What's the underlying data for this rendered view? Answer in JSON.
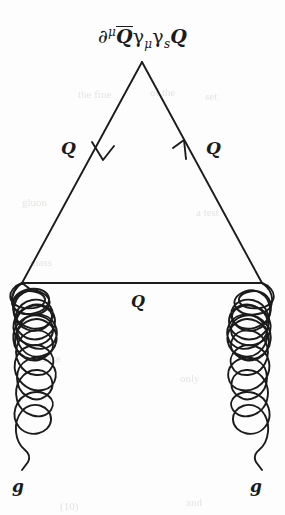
{
  "figure": {
    "kind": "feynman-diagram",
    "width": 285,
    "height": 515,
    "background_color": "#fdfdfd",
    "ink_color": "#1b1b1b"
  },
  "labels": {
    "operator": {
      "full_text": "∂ᵘ Q̄ γμ γs Q",
      "derivative": "∂",
      "derivative_superscript": "μ",
      "qbar": "Q",
      "gamma_one": "γ",
      "gamma_one_subscript": "μ",
      "gamma_two": "γ",
      "gamma_two_subscript": "s",
      "q_final": "Q"
    },
    "quark_left": "Q",
    "quark_right": "Q",
    "quark_middle": "Q",
    "gluon_left": "g",
    "gluon_right": "g"
  },
  "geometry": {
    "apex": {
      "x": 142,
      "y": 62
    },
    "bottom_left_vertex": {
      "x": 22,
      "y": 283
    },
    "bottom_right_vertex": {
      "x": 262,
      "y": 283
    },
    "gluon_left_x": 22,
    "gluon_right_x": 262,
    "gluon_top_y": 283,
    "gluon_bottom_y": 470,
    "gluon_loop_count": 6,
    "arrow_left": {
      "x": 101,
      "y": 154,
      "direction": "down-left"
    },
    "arrow_right": {
      "x": 184,
      "y": 154,
      "direction": "up-left"
    },
    "stroke_width": 1.9
  },
  "ghost_text": [
    {
      "text": "the fine",
      "x": 78,
      "y": 88
    },
    {
      "text": "of the",
      "x": 150,
      "y": 86
    },
    {
      "text": "set",
      "x": 205,
      "y": 90
    },
    {
      "text": "gluon",
      "x": 22,
      "y": 196
    },
    {
      "text": "a test",
      "x": 196,
      "y": 206
    },
    {
      "text": "mass",
      "x": 30,
      "y": 256
    },
    {
      "text": "only",
      "x": 180,
      "y": 372
    },
    {
      "text": "case",
      "x": 42,
      "y": 352
    },
    {
      "text": "(10)",
      "x": 60,
      "y": 500
    },
    {
      "text": "and",
      "x": 186,
      "y": 496
    }
  ]
}
